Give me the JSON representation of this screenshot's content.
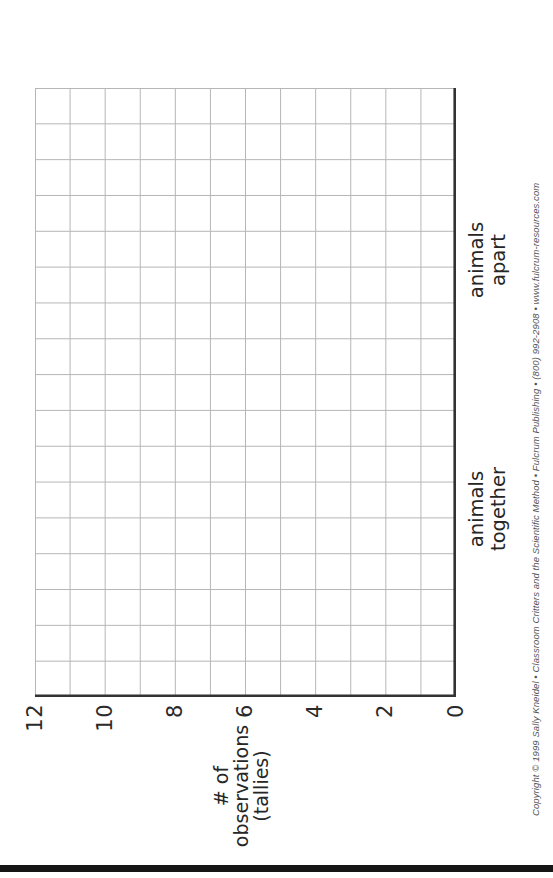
{
  "chart": {
    "ylabel_lines": [
      "# of",
      "observations",
      "(tallies)"
    ],
    "yticks": [
      "12",
      "10",
      "8",
      "6",
      "4",
      "2",
      "0"
    ],
    "categories": [
      {
        "line1": "animals",
        "line2": "together"
      },
      {
        "line1": "animals",
        "line2": "apart"
      }
    ]
  },
  "footer": {
    "copyright": "Copyright © 1999 Sally Kneidel • Classroom Critters and the Scientific Method • Fulcrum Publishing • (800) 992-2908 • www.fulcrum-resources.com"
  },
  "chart_data": {
    "type": "bar",
    "title": "",
    "categories": [
      "animals together",
      "animals apart"
    ],
    "values": [
      null,
      null
    ],
    "series": [],
    "xlabel": "",
    "ylabel": "# of observations (tallies)",
    "yticks": [
      0,
      2,
      4,
      6,
      8,
      10,
      12
    ],
    "ylim": [
      0,
      12
    ],
    "grid": true,
    "note": "blank tally-graph worksheet — no data plotted",
    "layout": {
      "orientation": "landscape sheet rotated 90° CCW",
      "grid_cols": 17,
      "grid_rows": 12,
      "grid_line_color": "#b6b6b6",
      "axis_line_color": "#333333",
      "edge_bar_color": "#151515"
    }
  }
}
